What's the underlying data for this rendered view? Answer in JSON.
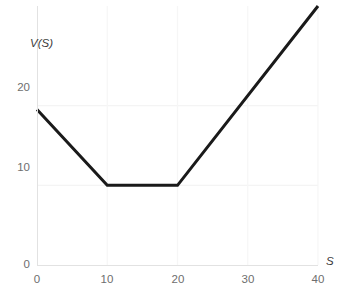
{
  "chart_data": {
    "type": "line",
    "title": "",
    "subtitle": "",
    "xlabel": "S",
    "ylabel": "V(S)",
    "xlim": [
      0,
      40
    ],
    "ylim": [
      0,
      32.5
    ],
    "grid": true,
    "legend": null,
    "legend_position": "none",
    "x_ticks": [
      0,
      10,
      20,
      30,
      40
    ],
    "x_tick_labels": [
      "0",
      "10",
      "20",
      "30",
      "40"
    ],
    "y_ticks": [
      0,
      10,
      20
    ],
    "y_tick_labels": [
      "0",
      "10",
      "20"
    ],
    "series": [
      {
        "name": "V(S)",
        "color": "#1a1a1a",
        "line_width": 3,
        "x": [
          0,
          10,
          20,
          40
        ],
        "y": [
          19.5,
          10,
          10,
          32.5
        ],
        "note": "piecewise linear payoff: falls from 19.5 to 10 over S=0..10, flat at 10 for S=10..20, rises to 32.5 at S=40 (clipped at top of frame)"
      }
    ],
    "annotations": []
  },
  "axes": {
    "y_title": "V(S)",
    "x_title": "S",
    "y_tick_labels": [
      "20",
      "10",
      "0"
    ],
    "x_tick_labels": [
      "0",
      "10",
      "20",
      "30",
      "40"
    ]
  },
  "colors": {
    "background": "#ffffff",
    "line": "#1a1a1a",
    "grid": "#f4f4f4",
    "axis": "#e2e2e2",
    "tick_text": "#6e6e6e",
    "title_text": "#3a3a3a"
  },
  "caption": {
    "text": "",
    "visible": false
  }
}
